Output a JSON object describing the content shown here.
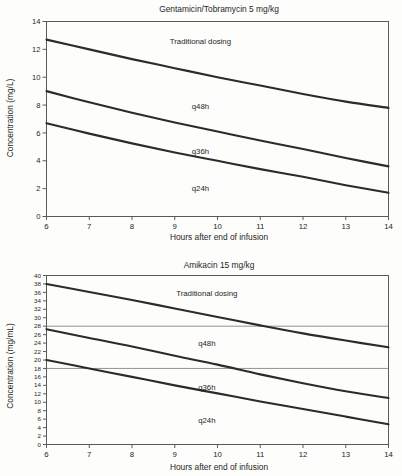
{
  "page": {
    "background_color": "#fdfdfc",
    "ink_color": "#1f1f1f"
  },
  "chart_data": [
    {
      "id": "gentamicin-tobramycin",
      "type": "line",
      "title": "Gentamicin/Tobramycin 5 mg/kg",
      "xlabel": "Hours after end of infusion",
      "ylabel": "Concentration (mg/L)",
      "xlim": [
        6,
        14
      ],
      "ylim": [
        0,
        14
      ],
      "xticks": [
        6,
        7,
        8,
        9,
        10,
        11,
        12,
        13,
        14
      ],
      "yticks": [
        0,
        2,
        4,
        6,
        8,
        10,
        12,
        14
      ],
      "grid": false,
      "legend": "inline-annotations",
      "x": [
        6,
        7,
        8,
        9,
        10,
        11,
        12,
        13,
        14
      ],
      "series": [
        {
          "name": "Traditional dosing",
          "label_x": 9.6,
          "label_y": 12.35,
          "values": [
            12.7,
            12.0,
            11.3,
            10.65,
            10.0,
            9.4,
            8.8,
            8.25,
            7.8
          ]
        },
        {
          "name": "q48h",
          "label_x": 9.6,
          "label_y": 7.7,
          "values": [
            9.0,
            8.2,
            7.45,
            6.75,
            6.1,
            5.45,
            4.85,
            4.2,
            3.6
          ]
        },
        {
          "name": "q36h",
          "label_x": 9.6,
          "label_y": 4.5,
          "values": null,
          "note": "label only; annotates the band between the q48h and q24h curves"
        },
        {
          "name": "q24h",
          "label_x": 9.6,
          "label_y": 1.85,
          "values": [
            6.7,
            5.95,
            5.25,
            4.6,
            4.0,
            3.4,
            2.85,
            2.25,
            1.7
          ]
        }
      ]
    },
    {
      "id": "amikacin",
      "type": "line",
      "title": "Amikacin 15 mg/kg",
      "xlabel": "Hours after end of infusion",
      "ylabel": "Concentration (mg/mL)",
      "xlim": [
        6,
        14
      ],
      "ylim": [
        0,
        40
      ],
      "xticks": [
        6,
        7,
        8,
        9,
        10,
        11,
        12,
        13,
        14
      ],
      "yticks": [
        0,
        2,
        4,
        6,
        8,
        10,
        12,
        14,
        16,
        18,
        20,
        22,
        24,
        26,
        28,
        30,
        32,
        34,
        36,
        38,
        40
      ],
      "grid": false,
      "legend": "inline-annotations",
      "reference_lines": [
        {
          "y": 28,
          "orientation": "horizontal"
        },
        {
          "y": 18,
          "orientation": "horizontal"
        }
      ],
      "x": [
        6,
        7,
        8,
        9,
        10,
        11,
        12,
        13,
        14
      ],
      "series": [
        {
          "name": "Traditional dosing",
          "label_x": 9.75,
          "label_y": 35.2,
          "values": [
            38.0,
            36.1,
            34.2,
            32.2,
            30.2,
            28.2,
            26.3,
            24.6,
            23.0
          ]
        },
        {
          "name": "q48h",
          "label_x": 9.75,
          "label_y": 23.3,
          "values": [
            27.3,
            25.2,
            23.2,
            21.0,
            18.9,
            16.6,
            14.5,
            12.6,
            11.0
          ]
        },
        {
          "name": "q36h",
          "label_x": 9.75,
          "label_y": 13.0,
          "values": null,
          "note": "label only; annotates the band between the q48h and q24h curves"
        },
        {
          "name": "q24h",
          "label_x": 9.75,
          "label_y": 5.2,
          "values": [
            20.0,
            18.0,
            16.0,
            14.0,
            12.1,
            10.2,
            8.4,
            6.6,
            4.8
          ]
        }
      ]
    }
  ]
}
